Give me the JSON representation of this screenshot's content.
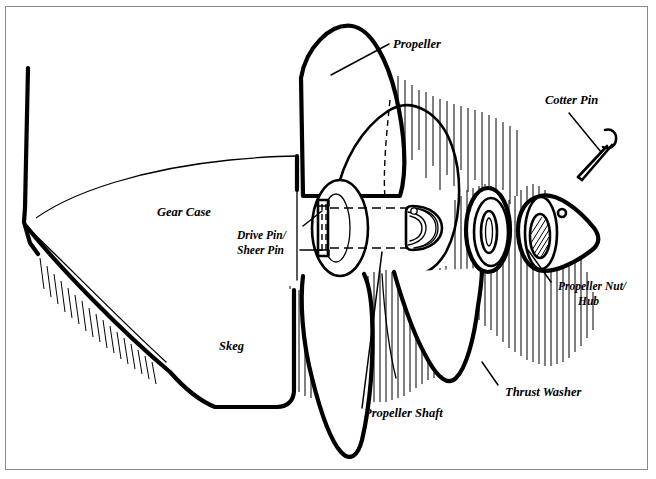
{
  "figure": {
    "background_color": "#ffffff",
    "ink_color": "#000000",
    "border_color": "#8a8a8a"
  },
  "labels": [
    {
      "id": "propeller",
      "text": "Propeller",
      "x": 393,
      "y": 48,
      "size": "lbl-12",
      "anchor": "start"
    },
    {
      "id": "cotter-pin",
      "text": "Cotter Pin",
      "x": 545,
      "y": 104,
      "size": "lbl-12",
      "anchor": "start"
    },
    {
      "id": "gear-case",
      "text": "Gear Case",
      "x": 157,
      "y": 216,
      "size": "lbl-12",
      "anchor": "start"
    },
    {
      "id": "drive-pin",
      "text": "Drive Pin/",
      "x": 237,
      "y": 239,
      "size": "lbl-11",
      "anchor": "start"
    },
    {
      "id": "sheer-pin",
      "text": "Sheer Pin",
      "x": 237,
      "y": 254,
      "size": "lbl-11",
      "anchor": "start"
    },
    {
      "id": "skeg",
      "text": "Skeg",
      "x": 219,
      "y": 350,
      "size": "lbl-12",
      "anchor": "start"
    },
    {
      "id": "propeller-nut",
      "text": "Propeller Nut/",
      "x": 558,
      "y": 290,
      "size": "lbl-11",
      "anchor": "start"
    },
    {
      "id": "hub",
      "text": "Hub",
      "x": 558,
      "y": 305,
      "size": "lbl-11",
      "anchor": "start"
    },
    {
      "id": "thrust-washer",
      "text": "Thrust Washer",
      "x": 505,
      "y": 396,
      "size": "lbl-12",
      "anchor": "start"
    },
    {
      "id": "propeller-shaft",
      "text": "Propeller Shaft",
      "x": 364,
      "y": 417,
      "size": "lbl-12",
      "anchor": "start"
    }
  ],
  "parts": [
    {
      "id": "gear-case",
      "name": "Gear Case",
      "callout_label": "Gear Case"
    },
    {
      "id": "skeg",
      "name": "Skeg",
      "callout_label": "Skeg"
    },
    {
      "id": "propeller",
      "name": "Propeller",
      "callout_label": "Propeller"
    },
    {
      "id": "propeller-shaft",
      "name": "Propeller Shaft",
      "callout_label": "Propeller Shaft"
    },
    {
      "id": "drive-pin",
      "name": "Drive Pin/Sheer Pin",
      "callout_label": "Drive Pin/ Sheer Pin"
    },
    {
      "id": "thrust-washer",
      "name": "Thrust Washer",
      "callout_label": "Thrust Washer"
    },
    {
      "id": "propeller-nut",
      "name": "Propeller Nut/Hub",
      "callout_label": "Propeller Nut/ Hub"
    },
    {
      "id": "cotter-pin",
      "name": "Cotter Pin",
      "callout_label": "Cotter Pin"
    }
  ]
}
